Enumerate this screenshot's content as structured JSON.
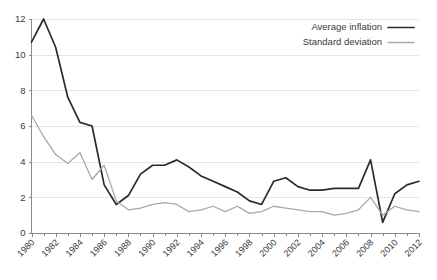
{
  "chart_data": {
    "type": "line",
    "title": "",
    "xlabel": "",
    "ylabel": "",
    "ylim": [
      0,
      12
    ],
    "yticks": [
      0,
      2,
      4,
      6,
      8,
      10,
      12
    ],
    "xlim": [
      1980,
      2012
    ],
    "grid": true,
    "legend_position": "top-right",
    "x": [
      1980,
      1981,
      1982,
      1983,
      1984,
      1985,
      1986,
      1987,
      1988,
      1989,
      1990,
      1991,
      1992,
      1993,
      1994,
      1995,
      1996,
      1997,
      1998,
      1999,
      2000,
      2001,
      2002,
      2003,
      2004,
      2005,
      2006,
      2007,
      2008,
      2009,
      2010,
      2011,
      2012
    ],
    "xticklabels": [
      "1980",
      "1982",
      "1984",
      "1986",
      "1988",
      "1990",
      "1992",
      "1994",
      "1996",
      "1998",
      "2000",
      "2002",
      "2004",
      "2006",
      "2008",
      "2010",
      "2012"
    ],
    "series": [
      {
        "name": "Average inflation",
        "color": "#2b2b2b",
        "width": 1.7,
        "values": [
          10.7,
          12.0,
          10.4,
          7.6,
          6.2,
          6.0,
          2.7,
          1.6,
          2.1,
          3.3,
          3.8,
          3.8,
          4.1,
          3.7,
          3.2,
          2.9,
          2.6,
          2.3,
          1.8,
          1.6,
          2.9,
          3.1,
          2.6,
          2.4,
          2.4,
          2.5,
          2.5,
          2.5,
          4.1,
          0.6,
          2.2,
          2.7,
          2.9
        ]
      },
      {
        "name": "Standard deviation",
        "color": "#a8a8a8",
        "width": 1.3,
        "values": [
          6.6,
          5.4,
          4.4,
          3.9,
          4.5,
          3.0,
          3.8,
          1.8,
          1.3,
          1.4,
          1.6,
          1.7,
          1.6,
          1.2,
          1.3,
          1.5,
          1.2,
          1.5,
          1.1,
          1.2,
          1.5,
          1.4,
          1.3,
          1.2,
          1.2,
          1.0,
          1.1,
          1.3,
          2.0,
          1.0,
          1.5,
          1.3,
          1.2
        ]
      }
    ]
  },
  "legend": {
    "items": [
      {
        "label": "Average inflation"
      },
      {
        "label": "Standard deviation"
      }
    ]
  }
}
